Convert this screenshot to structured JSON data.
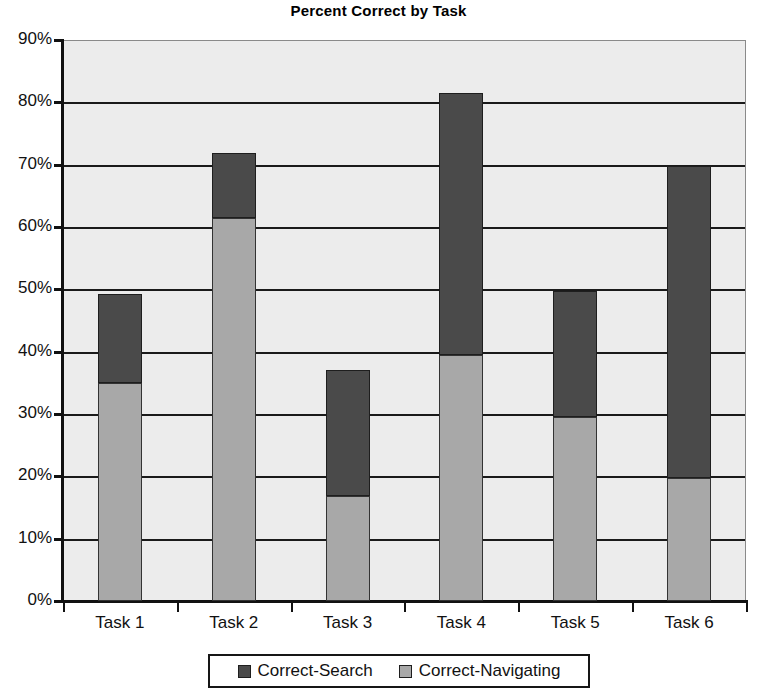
{
  "chart_data": {
    "type": "bar",
    "subtype": "stacked-bar",
    "title": "Percent Correct by Task",
    "xlabel": "",
    "ylabel": "",
    "categories": [
      "Task 1",
      "Task 2",
      "Task 3",
      "Task 4",
      "Task 5",
      "Task 6"
    ],
    "series": [
      {
        "name": "Correct-Search",
        "color": "#4a4a4a",
        "values": [
          14.2,
          10.4,
          20.2,
          42.0,
          20.2,
          50.0
        ]
      },
      {
        "name": "Correct-Navigating",
        "color": "#a8a8a8",
        "values": [
          35.0,
          61.5,
          16.8,
          39.5,
          29.5,
          19.8
        ]
      }
    ],
    "stack_totals": [
      49.2,
      71.9,
      37.0,
      81.5,
      49.7,
      69.8
    ],
    "ylim": [
      0,
      90
    ],
    "ytick_step": 10,
    "ytick_labels": [
      "0%",
      "10%",
      "20%",
      "30%",
      "40%",
      "50%",
      "60%",
      "70%",
      "80%",
      "90%"
    ],
    "ytick_values": [
      0,
      10,
      20,
      30,
      40,
      50,
      60,
      70,
      80,
      90
    ],
    "grid": true,
    "grid_axis": "y",
    "legend_position": "bottom",
    "legend_entries": [
      "Correct-Search",
      "Correct-Navigating"
    ],
    "plot_background": "#ececec",
    "stack_order": "Correct-Navigating bottom, Correct-Search top"
  }
}
